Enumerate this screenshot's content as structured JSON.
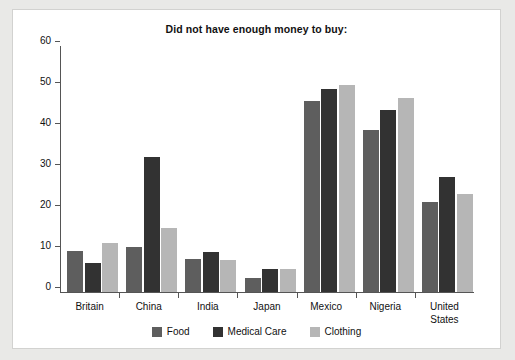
{
  "chart_data": {
    "type": "bar",
    "title": "Did not have enough money to buy:",
    "xlabel": "",
    "ylabel": "",
    "ylim": [
      0,
      60
    ],
    "yticks": [
      0,
      10,
      20,
      30,
      40,
      50,
      60
    ],
    "grid": false,
    "legend_position": "bottom",
    "categories": [
      "Britain",
      "China",
      "India",
      "Japan",
      "Mexico",
      "Nigeria",
      "United States"
    ],
    "series": [
      {
        "name": "Food",
        "color": "#5e5e5e",
        "values": [
          10,
          11,
          8,
          3.5,
          46.5,
          39.5,
          22
        ]
      },
      {
        "name": "Medical Care",
        "color": "#323232",
        "values": [
          7,
          33,
          9.7,
          5.5,
          49.5,
          44.3,
          28
        ]
      },
      {
        "name": "Clothing",
        "color": "#b6b6b6",
        "values": [
          12,
          15.5,
          7.8,
          5.5,
          50.5,
          47.3,
          24
        ]
      }
    ]
  }
}
